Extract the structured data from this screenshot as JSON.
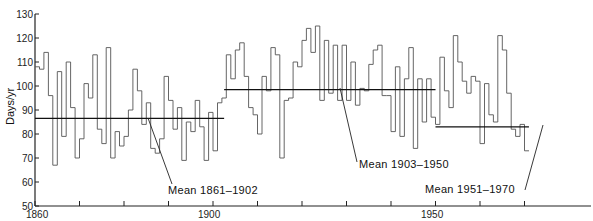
{
  "chart_data": {
    "type": "line",
    "style": "step",
    "title": "",
    "xlabel": "",
    "ylabel": "Days/yr",
    "xlim": [
      1860,
      1971
    ],
    "ylim": [
      50,
      130
    ],
    "grid": false,
    "x_ticks": [
      1860,
      1870,
      1880,
      1890,
      1900,
      1910,
      1920,
      1930,
      1940,
      1950,
      1960,
      1970
    ],
    "x_tick_labels": [
      {
        "value": 1860,
        "label": "1860"
      },
      {
        "value": 1900,
        "label": "1900"
      },
      {
        "value": 1950,
        "label": "1950"
      }
    ],
    "y_ticks": [
      50,
      60,
      70,
      80,
      90,
      100,
      110,
      120,
      130
    ],
    "y_tick_labels": [
      "50",
      "60",
      "70",
      "80",
      "90",
      "100",
      "110",
      "120",
      "130"
    ],
    "series": [
      {
        "name": "Annual days",
        "start_year": 1860,
        "values": [
          108,
          107,
          114,
          96,
          67,
          106,
          79,
          110,
          91,
          70,
          78,
          101,
          95,
          113,
          82,
          76,
          116,
          70,
          81,
          75,
          79,
          90,
          107,
          98,
          84,
          93,
          74,
          72,
          78,
          104,
          94,
          82,
          91,
          69,
          85,
          81,
          94,
          83,
          69,
          89,
          73,
          93,
          95,
          113,
          103,
          115,
          118,
          104,
          91,
          88,
          80,
          104,
          98,
          116,
          113,
          70,
          94,
          95,
          110,
          108,
          119,
          124,
          114,
          125,
          94,
          119,
          97,
          117,
          94,
          117,
          94,
          110,
          92,
          99,
          98,
          109,
          115,
          117,
          96,
          96,
          81,
          108,
          79,
          103,
          116,
          74,
          103,
          85,
          103,
          87,
          84,
          112,
          98,
          91,
          121,
          110,
          102,
          97,
          104,
          102,
          76,
          101,
          88,
          85,
          121,
          115,
          97,
          82,
          79,
          84,
          73
        ]
      }
    ],
    "means": [
      {
        "label": "Mean 1861–1902",
        "from": 1860,
        "to": 1902.5,
        "value": 86.5
      },
      {
        "label": "Mean 1903–1950",
        "from": 1902.5,
        "to": 1950,
        "value": 98.5
      },
      {
        "label": "Mean 1951–1970",
        "from": 1950,
        "to": 1971,
        "value": 83
      }
    ]
  },
  "annotations": {
    "mean1": "Mean 1861–1902",
    "mean2": "Mean 1903–1950",
    "mean3": "Mean 1951–1970"
  },
  "axes": {
    "ylabel": "Days/yr",
    "x1860": "1860",
    "x1900": "1900",
    "x1950": "1950"
  }
}
